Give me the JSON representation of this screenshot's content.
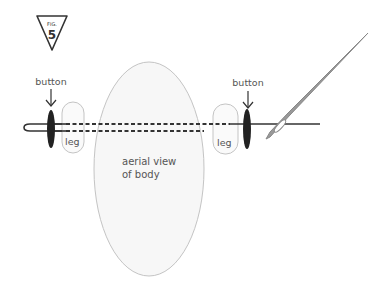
{
  "figure": {
    "badge_prefix": "FIG.",
    "badge_number": "5"
  },
  "labels": {
    "button_left": "button",
    "button_right": "button",
    "leg_left": "leg",
    "leg_right": "leg",
    "body_line1": "aerial view",
    "body_line2": "of body"
  },
  "colors": {
    "stroke": "#333333",
    "outline": "#bbbbbb",
    "body_fill": "#f7f7f7",
    "needle": "#888888",
    "button_fill": "#222222",
    "text": "#555555"
  }
}
